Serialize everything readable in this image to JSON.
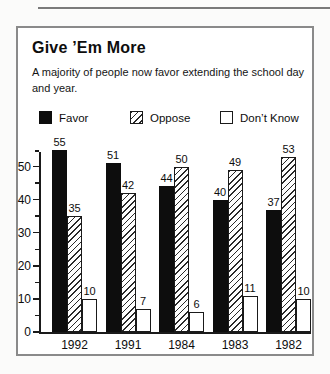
{
  "header": {
    "title": "Give ’Em More",
    "subtitle": "A majority of people now favor extending the school day and year."
  },
  "legend": {
    "items": [
      {
        "label": "Favor",
        "fill": "solid-black"
      },
      {
        "label": "Oppose",
        "fill": "diagonal-hatch"
      },
      {
        "label": "Don’t Know",
        "fill": "white-outline"
      }
    ]
  },
  "chart_data": {
    "type": "bar",
    "title": "Give ’Em More",
    "subtitle": "A majority of people now favor extending the school day and year.",
    "categories": [
      "1992",
      "1991",
      "1984",
      "1983",
      "1982"
    ],
    "series": [
      {
        "name": "Favor",
        "fill": "solid-black",
        "values": [
          55,
          51,
          44,
          40,
          37
        ]
      },
      {
        "name": "Oppose",
        "fill": "diagonal-hatch",
        "values": [
          35,
          42,
          50,
          49,
          53
        ]
      },
      {
        "name": "Don't Know",
        "fill": "white-outline",
        "values": [
          10,
          7,
          6,
          11,
          10
        ]
      }
    ],
    "bar_value_labels": true,
    "xlabel": "",
    "ylabel": "",
    "ylim": [
      0,
      55
    ],
    "yticks": [
      0,
      10,
      20,
      30,
      40,
      50
    ],
    "minor_tick_step": 5,
    "grid": false,
    "legend_position": "top"
  },
  "colors": {
    "bar_fill": "#0d0d0d",
    "hatch_line": "#2a2a2a",
    "axis": "#1a1a1a",
    "card_border": "#8a8a8a",
    "top_rule": "#7a7a7a",
    "background": "#ffffff"
  }
}
